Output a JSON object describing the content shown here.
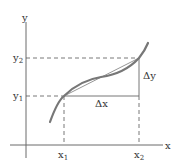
{
  "diagram": {
    "axes": {
      "x_label": "x",
      "y_label": "y"
    },
    "points": {
      "x1": {
        "label": "x",
        "sub": "1"
      },
      "x2": {
        "label": "x",
        "sub": "2"
      },
      "y1": {
        "label": "y",
        "sub": "1"
      },
      "y2": {
        "label": "y",
        "sub": "2"
      }
    },
    "increments": {
      "dx_label": "Δx",
      "dy_label": "Δy"
    },
    "colors": {
      "axis": "#6b6b6b",
      "curve": "#777777",
      "secant": "#8a8a8a",
      "dashed": "#555555",
      "text": "#333333"
    }
  }
}
